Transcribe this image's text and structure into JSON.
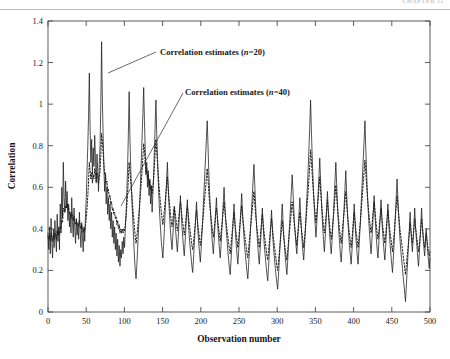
{
  "header": {
    "running_head": "CHAPTER 12"
  },
  "chart_data": {
    "type": "line",
    "title": "",
    "xlabel": "Observation number",
    "ylabel": "Correlation",
    "xlim": [
      0,
      500
    ],
    "ylim": [
      0,
      1.4
    ],
    "xticks": [
      0,
      50,
      100,
      150,
      200,
      250,
      300,
      350,
      400,
      450,
      500
    ],
    "yticks": [
      0,
      0.2,
      0.4,
      0.6,
      0.8,
      1,
      1.2,
      1.4
    ],
    "ytick_labels": [
      "0",
      "0.2",
      "0.4",
      "0.6",
      "0.8",
      "1",
      "1.2",
      "1.4"
    ],
    "xtick_labels": [
      "0",
      "50",
      "100",
      "150",
      "200",
      "250",
      "300",
      "350",
      "400",
      "450",
      "500"
    ],
    "grid": false,
    "legend": "annotations",
    "annotations": [
      {
        "name": "annotation-n20",
        "text_prefix": "Correlation estimates (",
        "text_italic": "n",
        "text_suffix": "=20)",
        "text_full": "Correlation estimates (n=20)",
        "text_x": 160,
        "text_y": 55,
        "leader_from": [
          156,
          52
        ],
        "leader_to": [
          108,
          73
        ]
      },
      {
        "name": "annotation-n40",
        "text_prefix": "Correlation estimates (",
        "text_italic": "n",
        "text_suffix": "=40)",
        "text_full": "Correlation estimates (n=40)",
        "text_x": 185,
        "text_y": 95,
        "leader_from": [
          183,
          93
        ],
        "leader_to": [
          121,
          206
        ]
      }
    ],
    "series": [
      {
        "name": "Correlation estimates (n=20)",
        "style": "solid",
        "color": "#1a1a1a",
        "x_start": 0,
        "x_step": 1,
        "values": [
          0.38,
          0.3,
          0.41,
          0.28,
          0.45,
          0.33,
          0.26,
          0.4,
          0.31,
          0.44,
          0.36,
          0.29,
          0.47,
          0.34,
          0.41,
          0.3,
          0.52,
          0.38,
          0.6,
          0.45,
          0.72,
          0.55,
          0.48,
          0.63,
          0.5,
          0.58,
          0.44,
          0.52,
          0.41,
          0.47,
          0.38,
          0.55,
          0.43,
          0.36,
          0.5,
          0.4,
          0.33,
          0.45,
          0.37,
          0.42,
          0.35,
          0.48,
          0.39,
          0.31,
          0.43,
          0.36,
          0.29,
          0.41,
          0.34,
          0.47,
          0.55,
          0.68,
          0.8,
          0.95,
          1.15,
          0.88,
          0.72,
          0.83,
          0.66,
          0.79,
          0.7,
          0.85,
          0.74,
          0.62,
          0.76,
          0.68,
          0.58,
          0.71,
          0.8,
          1.0,
          1.3,
          1.02,
          0.86,
          0.7,
          0.58,
          0.66,
          0.52,
          0.6,
          0.47,
          0.55,
          0.44,
          0.52,
          0.4,
          0.48,
          0.36,
          0.44,
          0.33,
          0.41,
          0.3,
          0.38,
          0.27,
          0.35,
          0.24,
          0.32,
          0.22,
          0.3,
          0.26,
          0.34,
          0.28,
          0.36,
          0.31,
          0.4,
          0.48,
          0.58,
          0.7,
          0.86,
          1.06,
          0.84,
          0.7,
          0.6,
          0.5,
          0.42,
          0.34,
          0.26,
          0.2,
          0.16,
          0.22,
          0.3,
          0.38,
          0.46,
          0.55,
          0.64,
          0.74,
          0.85,
          0.96,
          1.08,
          0.92,
          0.78,
          0.66,
          0.72,
          0.6,
          0.68,
          0.56,
          0.64,
          0.52,
          0.6,
          0.48,
          0.57,
          0.66,
          0.78,
          0.9,
          1.02,
          0.86,
          0.74,
          0.63,
          0.54,
          0.46,
          0.4,
          0.34,
          0.3,
          0.26,
          0.32,
          0.4,
          0.48,
          0.56,
          0.64,
          0.72,
          0.6,
          0.52,
          0.45,
          0.39,
          0.34,
          0.3,
          0.36,
          0.43,
          0.5,
          0.44,
          0.38,
          0.33,
          0.29,
          0.35,
          0.42,
          0.49,
          0.56,
          0.48,
          0.41,
          0.36,
          0.31,
          0.27,
          0.33,
          0.4,
          0.47,
          0.54,
          0.46,
          0.39,
          0.34,
          0.3,
          0.26,
          0.22,
          0.19,
          0.25,
          0.32,
          0.39,
          0.46,
          0.53,
          0.45,
          0.38,
          0.33,
          0.28,
          0.24,
          0.3,
          0.37,
          0.44,
          0.52,
          0.6,
          0.68,
          0.76,
          0.84,
          0.92,
          0.8,
          0.68,
          0.58,
          0.5,
          0.43,
          0.37,
          0.32,
          0.28,
          0.34,
          0.41,
          0.48,
          0.55,
          0.47,
          0.4,
          0.35,
          0.3,
          0.26,
          0.32,
          0.39,
          0.46,
          0.53,
          0.6,
          0.52,
          0.45,
          0.39,
          0.34,
          0.29,
          0.25,
          0.21,
          0.18,
          0.24,
          0.31,
          0.38,
          0.45,
          0.52,
          0.44,
          0.37,
          0.32,
          0.27,
          0.23,
          0.29,
          0.36,
          0.43,
          0.5,
          0.57,
          0.49,
          0.42,
          0.36,
          0.31,
          0.27,
          0.23,
          0.19,
          0.16,
          0.22,
          0.29,
          0.36,
          0.43,
          0.5,
          0.57,
          0.64,
          0.71,
          0.62,
          0.53,
          0.45,
          0.38,
          0.32,
          0.27,
          0.23,
          0.29,
          0.36,
          0.43,
          0.5,
          0.42,
          0.35,
          0.3,
          0.26,
          0.22,
          0.18,
          0.15,
          0.21,
          0.28,
          0.35,
          0.42,
          0.49,
          0.41,
          0.34,
          0.29,
          0.25,
          0.21,
          0.17,
          0.14,
          0.11,
          0.17,
          0.24,
          0.31,
          0.38,
          0.45,
          0.52,
          0.44,
          0.37,
          0.31,
          0.26,
          0.22,
          0.18,
          0.24,
          0.31,
          0.38,
          0.45,
          0.52,
          0.59,
          0.66,
          0.58,
          0.5,
          0.43,
          0.37,
          0.32,
          0.28,
          0.34,
          0.41,
          0.48,
          0.55,
          0.47,
          0.4,
          0.34,
          0.29,
          0.25,
          0.31,
          0.38,
          0.46,
          0.54,
          0.62,
          0.7,
          0.8,
          0.9,
          1.02,
          0.88,
          0.76,
          0.66,
          0.57,
          0.49,
          0.42,
          0.36,
          0.42,
          0.5,
          0.58,
          0.66,
          0.74,
          0.64,
          0.55,
          0.47,
          0.4,
          0.34,
          0.29,
          0.35,
          0.42,
          0.5,
          0.58,
          0.5,
          0.43,
          0.37,
          0.32,
          0.28,
          0.34,
          0.41,
          0.48,
          0.56,
          0.64,
          0.72,
          0.62,
          0.53,
          0.45,
          0.38,
          0.33,
          0.28,
          0.24,
          0.3,
          0.37,
          0.44,
          0.52,
          0.6,
          0.68,
          0.58,
          0.49,
          0.42,
          0.36,
          0.31,
          0.27,
          0.23,
          0.29,
          0.36,
          0.44,
          0.52,
          0.44,
          0.37,
          0.32,
          0.27,
          0.23,
          0.29,
          0.36,
          0.43,
          0.51,
          0.59,
          0.67,
          0.75,
          0.83,
          0.92,
          0.8,
          0.69,
          0.59,
          0.51,
          0.44,
          0.38,
          0.33,
          0.28,
          0.34,
          0.41,
          0.48,
          0.56,
          0.48,
          0.41,
          0.35,
          0.3,
          0.26,
          0.32,
          0.39,
          0.46,
          0.54,
          0.46,
          0.39,
          0.34,
          0.29,
          0.25,
          0.31,
          0.38,
          0.45,
          0.52,
          0.44,
          0.37,
          0.32,
          0.27,
          0.23,
          0.19,
          0.25,
          0.32,
          0.4,
          0.48,
          0.56,
          0.64,
          0.55,
          0.47,
          0.4,
          0.34,
          0.29,
          0.25,
          0.21,
          0.17,
          0.13,
          0.09,
          0.05,
          0.12,
          0.19,
          0.26,
          0.33,
          0.4,
          0.48,
          0.4,
          0.34,
          0.29,
          0.35,
          0.42,
          0.5,
          0.42,
          0.36,
          0.31,
          0.26,
          0.22,
          0.28,
          0.35,
          0.42,
          0.5,
          0.42,
          0.36,
          0.31,
          0.27,
          0.33,
          0.4,
          0.34,
          0.29,
          0.25,
          0.21,
          0.26
        ]
      },
      {
        "name": "Correlation estimates (n=40)",
        "style": "dotted",
        "color": "#1a1a1a",
        "x_start": 0,
        "x_step": 1,
        "values": [
          0.36,
          0.35,
          0.37,
          0.34,
          0.38,
          0.36,
          0.34,
          0.37,
          0.35,
          0.38,
          0.37,
          0.35,
          0.39,
          0.37,
          0.39,
          0.37,
          0.41,
          0.4,
          0.44,
          0.43,
          0.5,
          0.49,
          0.48,
          0.51,
          0.5,
          0.52,
          0.49,
          0.5,
          0.47,
          0.48,
          0.45,
          0.48,
          0.46,
          0.44,
          0.46,
          0.44,
          0.42,
          0.44,
          0.42,
          0.43,
          0.41,
          0.44,
          0.42,
          0.4,
          0.42,
          0.4,
          0.38,
          0.4,
          0.39,
          0.42,
          0.45,
          0.5,
          0.56,
          0.63,
          0.72,
          0.68,
          0.64,
          0.67,
          0.62,
          0.66,
          0.64,
          0.69,
          0.67,
          0.63,
          0.67,
          0.65,
          0.62,
          0.65,
          0.68,
          0.75,
          0.86,
          0.82,
          0.77,
          0.71,
          0.66,
          0.67,
          0.62,
          0.63,
          0.58,
          0.59,
          0.55,
          0.56,
          0.52,
          0.53,
          0.49,
          0.5,
          0.47,
          0.48,
          0.45,
          0.46,
          0.42,
          0.44,
          0.4,
          0.42,
          0.38,
          0.4,
          0.38,
          0.4,
          0.38,
          0.4,
          0.39,
          0.42,
          0.46,
          0.51,
          0.57,
          0.64,
          0.72,
          0.68,
          0.63,
          0.59,
          0.54,
          0.49,
          0.45,
          0.4,
          0.36,
          0.33,
          0.36,
          0.4,
          0.44,
          0.48,
          0.53,
          0.58,
          0.63,
          0.69,
          0.75,
          0.81,
          0.78,
          0.72,
          0.67,
          0.69,
          0.64,
          0.66,
          0.61,
          0.63,
          0.59,
          0.61,
          0.57,
          0.6,
          0.64,
          0.7,
          0.77,
          0.83,
          0.78,
          0.72,
          0.66,
          0.61,
          0.56,
          0.52,
          0.48,
          0.45,
          0.42,
          0.45,
          0.49,
          0.53,
          0.57,
          0.61,
          0.65,
          0.6,
          0.55,
          0.51,
          0.47,
          0.44,
          0.41,
          0.44,
          0.48,
          0.51,
          0.48,
          0.45,
          0.42,
          0.39,
          0.42,
          0.46,
          0.5,
          0.53,
          0.5,
          0.46,
          0.43,
          0.4,
          0.37,
          0.4,
          0.44,
          0.48,
          0.51,
          0.48,
          0.44,
          0.41,
          0.38,
          0.35,
          0.32,
          0.3,
          0.33,
          0.37,
          0.41,
          0.45,
          0.49,
          0.45,
          0.41,
          0.38,
          0.35,
          0.32,
          0.35,
          0.39,
          0.43,
          0.47,
          0.52,
          0.56,
          0.6,
          0.65,
          0.69,
          0.64,
          0.58,
          0.53,
          0.49,
          0.45,
          0.42,
          0.39,
          0.36,
          0.39,
          0.43,
          0.47,
          0.5,
          0.47,
          0.43,
          0.4,
          0.37,
          0.34,
          0.38,
          0.41,
          0.45,
          0.49,
          0.53,
          0.49,
          0.45,
          0.42,
          0.39,
          0.36,
          0.33,
          0.3,
          0.28,
          0.32,
          0.36,
          0.4,
          0.44,
          0.48,
          0.44,
          0.4,
          0.37,
          0.34,
          0.31,
          0.35,
          0.39,
          0.43,
          0.47,
          0.51,
          0.47,
          0.43,
          0.4,
          0.37,
          0.34,
          0.31,
          0.28,
          0.26,
          0.3,
          0.34,
          0.38,
          0.42,
          0.46,
          0.5,
          0.54,
          0.58,
          0.53,
          0.48,
          0.44,
          0.4,
          0.37,
          0.34,
          0.31,
          0.35,
          0.39,
          0.43,
          0.47,
          0.43,
          0.39,
          0.36,
          0.33,
          0.3,
          0.27,
          0.25,
          0.29,
          0.33,
          0.37,
          0.41,
          0.45,
          0.41,
          0.37,
          0.34,
          0.31,
          0.28,
          0.25,
          0.22,
          0.2,
          0.24,
          0.28,
          0.32,
          0.36,
          0.4,
          0.44,
          0.4,
          0.36,
          0.33,
          0.3,
          0.27,
          0.25,
          0.29,
          0.33,
          0.37,
          0.41,
          0.45,
          0.49,
          0.53,
          0.49,
          0.45,
          0.41,
          0.38,
          0.35,
          0.32,
          0.36,
          0.4,
          0.44,
          0.48,
          0.44,
          0.4,
          0.37,
          0.34,
          0.31,
          0.35,
          0.39,
          0.44,
          0.49,
          0.54,
          0.59,
          0.65,
          0.71,
          0.78,
          0.73,
          0.67,
          0.61,
          0.56,
          0.51,
          0.47,
          0.43,
          0.47,
          0.51,
          0.55,
          0.6,
          0.65,
          0.59,
          0.54,
          0.49,
          0.45,
          0.41,
          0.38,
          0.41,
          0.45,
          0.49,
          0.54,
          0.49,
          0.45,
          0.41,
          0.38,
          0.35,
          0.38,
          0.42,
          0.46,
          0.51,
          0.56,
          0.61,
          0.56,
          0.51,
          0.47,
          0.43,
          0.39,
          0.36,
          0.33,
          0.37,
          0.41,
          0.45,
          0.49,
          0.54,
          0.58,
          0.53,
          0.48,
          0.44,
          0.4,
          0.37,
          0.34,
          0.31,
          0.35,
          0.39,
          0.44,
          0.48,
          0.44,
          0.4,
          0.37,
          0.34,
          0.31,
          0.35,
          0.39,
          0.43,
          0.48,
          0.53,
          0.58,
          0.63,
          0.68,
          0.73,
          0.68,
          0.62,
          0.57,
          0.52,
          0.48,
          0.44,
          0.41,
          0.38,
          0.41,
          0.45,
          0.49,
          0.53,
          0.49,
          0.45,
          0.41,
          0.38,
          0.35,
          0.38,
          0.42,
          0.46,
          0.5,
          0.46,
          0.42,
          0.39,
          0.36,
          0.33,
          0.37,
          0.41,
          0.45,
          0.49,
          0.45,
          0.41,
          0.38,
          0.35,
          0.32,
          0.29,
          0.33,
          0.37,
          0.42,
          0.47,
          0.52,
          0.56,
          0.51,
          0.47,
          0.43,
          0.39,
          0.36,
          0.33,
          0.3,
          0.27,
          0.24,
          0.21,
          0.18,
          0.22,
          0.26,
          0.3,
          0.34,
          0.38,
          0.43,
          0.39,
          0.36,
          0.33,
          0.36,
          0.4,
          0.45,
          0.41,
          0.38,
          0.35,
          0.32,
          0.29,
          0.32,
          0.36,
          0.4,
          0.45,
          0.41,
          0.37,
          0.34,
          0.31,
          0.34,
          0.38,
          0.35,
          0.32,
          0.29,
          0.27,
          0.29
        ]
      }
    ]
  }
}
